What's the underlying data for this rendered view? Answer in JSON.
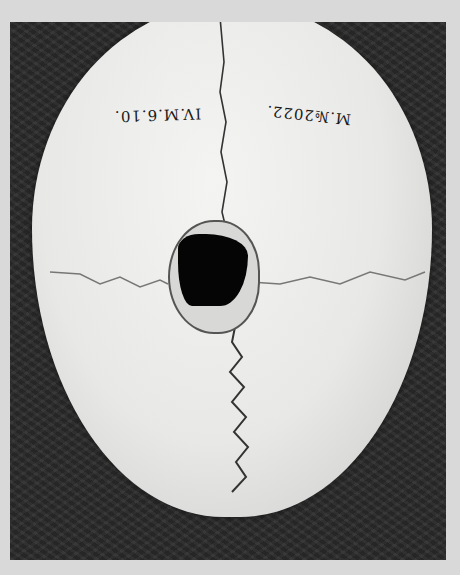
{
  "image": {
    "subject": "skull-top-view",
    "labels": {
      "left": "IV.M.6.10.",
      "right": "M.№2022."
    },
    "colors": {
      "border": "#d9d9d9",
      "background": "#2a2a2a",
      "bone": "#ececea",
      "hole": "#050505"
    }
  }
}
